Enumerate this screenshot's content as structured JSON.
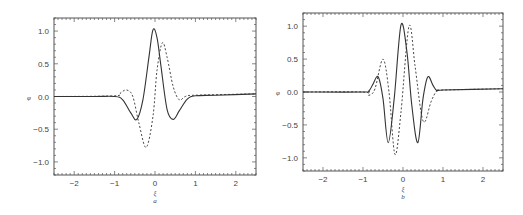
{
  "chart_data": [
    {
      "type": "line",
      "panel_label": "a",
      "xlabel": "ξ",
      "ylabel": "φ",
      "xlim": [
        -2.5,
        2.5
      ],
      "ylim": [
        -1.2,
        1.2
      ],
      "xticks": [
        "-2",
        "-1",
        "0",
        "1",
        "2"
      ],
      "yticks": [
        "1.0",
        "0.5",
        "0.0",
        "-0.5",
        "-1.0"
      ],
      "grid": false,
      "legend": null,
      "series": [
        {
          "name": "solid",
          "style": "solid",
          "x": [
            -2.5,
            -1.5,
            -1.0,
            -0.8,
            -0.6,
            -0.45,
            -0.3,
            -0.15,
            -0.05,
            0.05,
            0.15,
            0.3,
            0.45,
            0.6,
            0.8,
            1.0,
            1.5,
            2.5
          ],
          "y": [
            0.0,
            0.0,
            0.0,
            -0.05,
            -0.25,
            -0.35,
            -0.05,
            0.6,
            1.02,
            0.9,
            0.45,
            -0.2,
            -0.35,
            -0.22,
            -0.04,
            0.01,
            0.02,
            0.04
          ]
        },
        {
          "name": "dashed",
          "style": "dashed",
          "x": [
            -2.5,
            -1.0,
            -0.85,
            -0.7,
            -0.55,
            -0.4,
            -0.22,
            -0.05,
            0.05,
            0.18,
            0.3,
            0.45,
            0.6,
            0.75,
            1.0,
            2.5
          ],
          "y": [
            0.0,
            0.01,
            0.06,
            0.1,
            0.0,
            -0.4,
            -0.78,
            -0.3,
            0.4,
            0.82,
            0.6,
            0.15,
            -0.05,
            0.0,
            0.02,
            0.04
          ]
        }
      ]
    },
    {
      "type": "line",
      "panel_label": "b",
      "xlabel": "ξ",
      "ylabel": "φ",
      "xlim": [
        -2.5,
        2.5
      ],
      "ylim": [
        -1.2,
        1.2
      ],
      "xticks": [
        "-2",
        "-1",
        "0",
        "1",
        "2"
      ],
      "yticks": [
        "1.0",
        "0.5",
        "0.0",
        "-0.5",
        "-1.0"
      ],
      "grid": false,
      "legend": null,
      "series": [
        {
          "name": "solid",
          "style": "solid",
          "x": [
            -2.5,
            -1.0,
            -0.85,
            -0.75,
            -0.62,
            -0.5,
            -0.37,
            -0.22,
            -0.05,
            0.1,
            0.22,
            0.37,
            0.5,
            0.62,
            0.75,
            0.85,
            1.0,
            2.5
          ],
          "y": [
            0.0,
            0.0,
            0.02,
            0.12,
            0.23,
            -0.1,
            -0.77,
            -0.1,
            1.02,
            0.6,
            -0.2,
            -0.77,
            -0.1,
            0.23,
            0.1,
            0.02,
            0.03,
            0.05
          ]
        },
        {
          "name": "dashed",
          "style": "dashed",
          "x": [
            -2.5,
            -1.0,
            -0.85,
            -0.7,
            -0.5,
            -0.35,
            -0.2,
            -0.05,
            0.15,
            0.3,
            0.45,
            0.55,
            0.7,
            0.85,
            1.0,
            2.5
          ],
          "y": [
            0.0,
            0.0,
            -0.05,
            0.05,
            0.5,
            0.0,
            -0.95,
            -0.3,
            1.0,
            0.4,
            -0.3,
            -0.45,
            -0.15,
            0.02,
            0.03,
            0.05
          ]
        }
      ]
    }
  ]
}
